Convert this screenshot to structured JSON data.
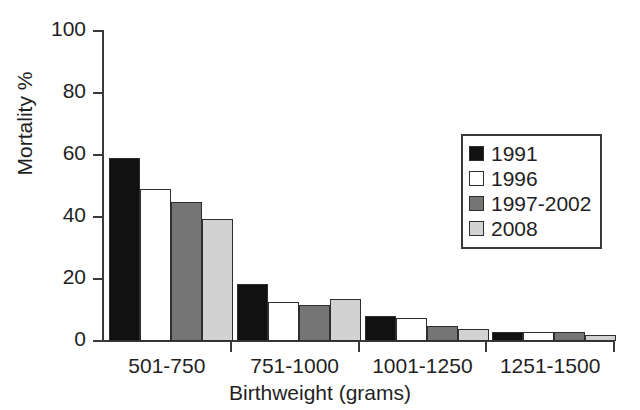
{
  "chart_data": {
    "type": "bar",
    "title": "",
    "xlabel": "Birthweight (grams)",
    "ylabel": "Mortality %",
    "categories": [
      "501-750",
      "751-1000",
      "1001-1250",
      "1251-1500"
    ],
    "series": [
      {
        "name": "1991",
        "color": "#111111",
        "values": [
          59,
          18.5,
          8,
          3
        ]
      },
      {
        "name": "1996",
        "color": "#ffffff",
        "values": [
          49,
          12.5,
          7.5,
          2.8
        ]
      },
      {
        "name": "1997-2002",
        "color": "#757575",
        "values": [
          45,
          11.5,
          5,
          3
        ]
      },
      {
        "name": "2008",
        "color": "#d2d2d2",
        "values": [
          39.5,
          13.5,
          4,
          2
        ]
      }
    ],
    "ylim": [
      0,
      100
    ],
    "y_ticks": [
      0,
      20,
      40,
      60,
      80,
      100
    ],
    "y_tick_labels": [
      "0",
      "20",
      "40",
      "60",
      "80",
      "100"
    ],
    "grid": false,
    "legend_position": "upper-right",
    "legend_entries": [
      "1991",
      "1996",
      "1997-2002",
      "2008"
    ]
  }
}
